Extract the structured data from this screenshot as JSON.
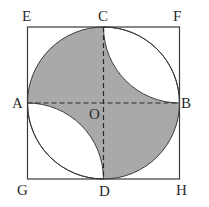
{
  "diagram": {
    "colors": {
      "shade": "#a9a9a9",
      "stroke": "#3a3a3a",
      "background": "#ffffff"
    },
    "labels": {
      "E": "E",
      "C": "C",
      "F": "F",
      "A": "A",
      "O": "O",
      "B": "B",
      "G": "G",
      "D": "D",
      "H": "H"
    }
  }
}
